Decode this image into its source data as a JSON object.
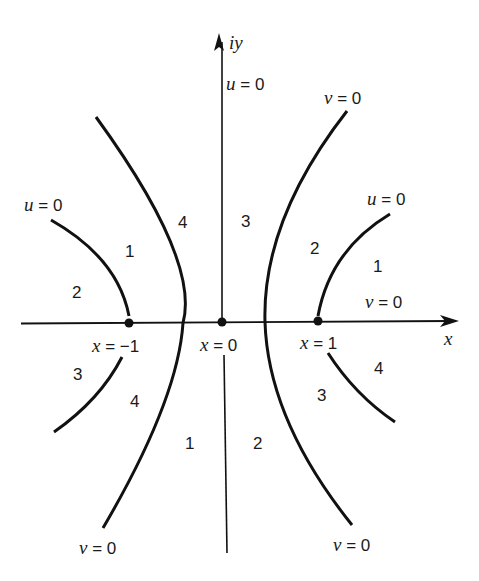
{
  "diagram": {
    "axes": {
      "horizontal_label": "x",
      "vertical_label": "iy"
    },
    "points": [
      {
        "label_var": "x",
        "label_eq": " = ",
        "label_val": "−1"
      },
      {
        "label_var": "x",
        "label_eq": " = ",
        "label_val": "0"
      },
      {
        "label_var": "x",
        "label_eq": " = ",
        "label_val": "1"
      }
    ],
    "curve_labels": {
      "top_center_u": {
        "var": "u",
        "eq": " = ",
        "val": "0"
      },
      "top_right_v": {
        "var": "v",
        "eq": " = ",
        "val": "0"
      },
      "left_u": {
        "var": "u",
        "eq": " = ",
        "val": "0"
      },
      "right_u": {
        "var": "u",
        "eq": " = ",
        "val": "0"
      },
      "right_axis_v": {
        "var": "v",
        "eq": " = ",
        "val": "0"
      },
      "bottom_left_v": {
        "var": "v",
        "eq": " = ",
        "val": "0"
      },
      "bottom_right_v": {
        "var": "v",
        "eq": " = ",
        "val": "0"
      }
    },
    "region_labels": {
      "upper_left_inner_1": "1",
      "upper_left_outer_2": "2",
      "upper_left_mid_4": "4",
      "upper_center_3": "3",
      "upper_right_mid_2": "2",
      "upper_right_outer_1": "1",
      "lower_left_outer_3": "3",
      "lower_left_mid_4": "4",
      "lower_center_1": "1",
      "lower_center_2": "2",
      "lower_right_mid_3": "3",
      "lower_right_outer_4": "4"
    },
    "colors": {
      "stroke": "#111111",
      "background": "#ffffff"
    }
  }
}
